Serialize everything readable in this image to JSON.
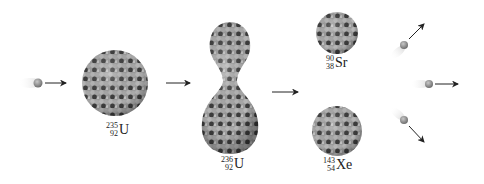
{
  "diagram": {
    "type": "nuclear-fission-process",
    "colors": {
      "background": "#ffffff",
      "nucleon_light": "#a8a8a8",
      "nucleon_dark": "#3a3a3a",
      "neutron": "#8a8a8a",
      "arrow": "#222222"
    },
    "stages": [
      {
        "id": "incoming-neutron",
        "label": ""
      },
      {
        "id": "uranium-235",
        "mass": "235",
        "atomic": "92",
        "symbol": "U"
      },
      {
        "id": "uranium-236",
        "mass": "236",
        "atomic": "92",
        "symbol": "U"
      },
      {
        "id": "strontium-90",
        "mass": "90",
        "atomic": "38",
        "symbol": "Sr"
      },
      {
        "id": "xenon-143",
        "mass": "143",
        "atomic": "54",
        "symbol": "Xe"
      },
      {
        "id": "released-neutrons",
        "count": 3
      }
    ]
  }
}
